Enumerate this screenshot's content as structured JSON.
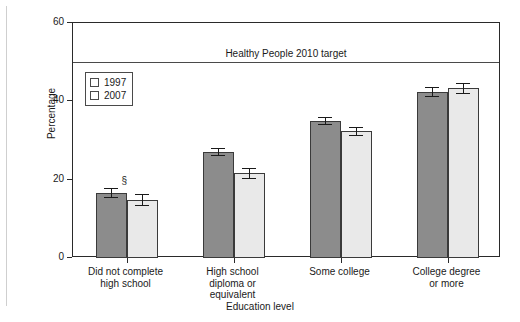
{
  "chart_data": {
    "type": "bar",
    "title": "",
    "xlabel": "Education level",
    "ylabel": "Percentage",
    "categories": [
      "Did not complete\nhigh school",
      "High school\ndiploma or\nequivalent",
      "Some college",
      "College degree\nor more"
    ],
    "category_lines": [
      [
        "Did not complete",
        "high school"
      ],
      [
        "High school",
        "diploma or",
        "equivalent"
      ],
      [
        "Some college"
      ],
      [
        "College degree",
        "or more"
      ]
    ],
    "series": [
      {
        "name": "1997",
        "color": "#8c8c8c",
        "values": [
          16.6,
          27.0,
          35.0,
          42.3
        ],
        "err_low": [
          1.2,
          1.0,
          1.0,
          1.3
        ],
        "err_high": [
          1.2,
          1.0,
          1.0,
          1.3
        ]
      },
      {
        "name": "2007",
        "color": "#e9e9e9",
        "values": [
          14.9,
          21.6,
          32.3,
          43.3
        ],
        "err_low": [
          1.5,
          1.4,
          1.2,
          1.5
        ],
        "err_high": [
          1.5,
          1.4,
          1.2,
          1.5
        ]
      }
    ],
    "annotations": [
      {
        "text": "§",
        "group": 0,
        "series": 0
      }
    ],
    "reference_line": {
      "label": "Healthy People 2010 target",
      "value": 50
    },
    "ylim": [
      0,
      60
    ],
    "yticks": [
      0,
      20,
      40,
      60
    ],
    "ytick_labels": [
      "0",
      "20",
      "40",
      "60"
    ],
    "grid": false,
    "legend_position": "upper left inside"
  }
}
